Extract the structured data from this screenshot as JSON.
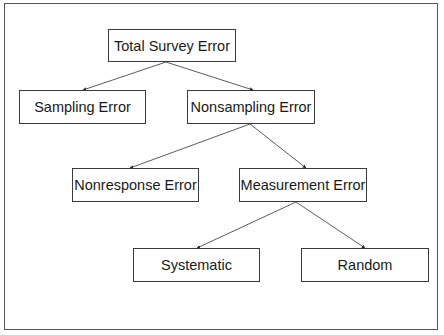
{
  "diagram": {
    "type": "tree",
    "colors": {
      "border": "#3a3a3a",
      "text": "#1a1a1a",
      "edge": "#4a4a4a",
      "background": "#ffffff"
    },
    "nodes": {
      "total": {
        "label": "Total Survey Error",
        "x": 108,
        "y": 29,
        "w": 128,
        "h": 33
      },
      "sampling": {
        "label": "Sampling Error",
        "x": 19,
        "y": 90,
        "w": 127,
        "h": 34
      },
      "nonsampling": {
        "label": "Nonsampling Error",
        "x": 187,
        "y": 90,
        "w": 128,
        "h": 34
      },
      "nonresponse": {
        "label": "Nonresponse Error",
        "x": 72,
        "y": 168,
        "w": 127,
        "h": 34
      },
      "measurement": {
        "label": "Measurement Error",
        "x": 239,
        "y": 168,
        "w": 128,
        "h": 34
      },
      "systematic": {
        "label": "Systematic",
        "x": 133,
        "y": 248,
        "w": 127,
        "h": 34
      },
      "random": {
        "label": "Random",
        "x": 301,
        "y": 248,
        "w": 128,
        "h": 34
      }
    },
    "edges": [
      {
        "from": "total",
        "to": "sampling",
        "x1": 166,
        "y1": 62,
        "x2": 83,
        "y2": 90
      },
      {
        "from": "total",
        "to": "nonsampling",
        "x1": 166,
        "y1": 62,
        "x2": 253,
        "y2": 90
      },
      {
        "from": "nonsampling",
        "to": "nonresponse",
        "x1": 250,
        "y1": 124,
        "x2": 130,
        "y2": 168
      },
      {
        "from": "nonsampling",
        "to": "measurement",
        "x1": 250,
        "y1": 124,
        "x2": 306,
        "y2": 168
      },
      {
        "from": "measurement",
        "to": "systematic",
        "x1": 296,
        "y1": 202,
        "x2": 197,
        "y2": 248
      },
      {
        "from": "measurement",
        "to": "random",
        "x1": 296,
        "y1": 202,
        "x2": 365,
        "y2": 248
      }
    ]
  }
}
